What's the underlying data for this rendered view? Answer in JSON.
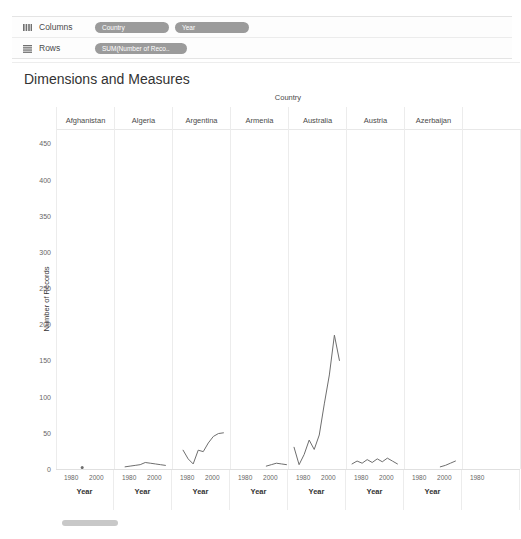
{
  "shelves": [
    {
      "label": "Columns",
      "icon": "columns-icon",
      "pills": [
        {
          "text": "Country",
          "wide": false
        },
        {
          "text": "Year",
          "wide": false
        }
      ]
    },
    {
      "label": "Rows",
      "icon": "rows-icon",
      "pills": [
        {
          "text": "SUM(Number of Reco..",
          "wide": true
        }
      ]
    }
  ],
  "sheet": {
    "title": "Dimensions and Measures"
  },
  "chart_data": {
    "type": "line",
    "title": "Dimensions and Measures",
    "column_field_label": "Country",
    "xlabel": "Year",
    "ylabel": "Number of Records",
    "ylim": [
      0,
      470
    ],
    "yticks": [
      0,
      50,
      100,
      150,
      200,
      250,
      300,
      350,
      400,
      450
    ],
    "xticks": [
      1980,
      2000
    ],
    "xlim": [
      1968,
      2014
    ],
    "grid": false,
    "legend": "none",
    "line_color": "#6e6e6e",
    "panel_field": "Country",
    "panels": [
      {
        "category": "Afghanistan",
        "x": [
          1988
        ],
        "values": [
          2
        ]
      },
      {
        "category": "Algeria",
        "x": [
          1976,
          1980,
          1984,
          1988,
          1992,
          1996,
          2000,
          2004,
          2008
        ],
        "values": [
          3,
          4,
          5,
          6,
          9,
          8,
          7,
          6,
          5
        ]
      },
      {
        "category": "Argentina",
        "x": [
          1976,
          1980,
          1984,
          1988,
          1992,
          1996,
          2000,
          2004,
          2008
        ],
        "values": [
          26,
          14,
          7,
          26,
          24,
          36,
          45,
          49,
          50
        ]
      },
      {
        "category": "Armenia",
        "x": [
          1996,
          2000,
          2004,
          2008,
          2012
        ],
        "values": [
          4,
          6,
          8,
          7,
          6
        ]
      },
      {
        "category": "Australia",
        "x": [
          1972,
          1976,
          1980,
          1984,
          1988,
          1992,
          1996,
          2000,
          2004,
          2008
        ],
        "values": [
          30,
          6,
          20,
          40,
          27,
          47,
          90,
          130,
          185,
          150
        ]
      },
      {
        "category": "Austria",
        "x": [
          1972,
          1976,
          1980,
          1984,
          1988,
          1992,
          1996,
          2000,
          2004,
          2008
        ],
        "values": [
          7,
          11,
          8,
          13,
          9,
          14,
          10,
          15,
          11,
          7
        ]
      },
      {
        "category": "Azerbaijan",
        "x": [
          1996,
          2000,
          2004,
          2008
        ],
        "values": [
          3,
          5,
          8,
          11
        ]
      },
      {
        "category": "",
        "x": [],
        "values": []
      }
    ]
  },
  "xaxis_panels": [
    {
      "ticks": [
        "1980",
        "2000"
      ],
      "title": "Year"
    },
    {
      "ticks": [
        "1980",
        "2000"
      ],
      "title": "Year"
    },
    {
      "ticks": [
        "1980",
        "2000"
      ],
      "title": "Year"
    },
    {
      "ticks": [
        "1980",
        "2000"
      ],
      "title": "Year"
    },
    {
      "ticks": [
        "1980",
        "2000"
      ],
      "title": "Year"
    },
    {
      "ticks": [
        "1980",
        "2000"
      ],
      "title": "Year"
    },
    {
      "ticks": [
        "1980",
        "2000"
      ],
      "title": "Year"
    },
    {
      "ticks": [
        "1980"
      ],
      "title": ""
    }
  ],
  "scrollbar": {
    "name": "horizontal-scrollbar"
  }
}
